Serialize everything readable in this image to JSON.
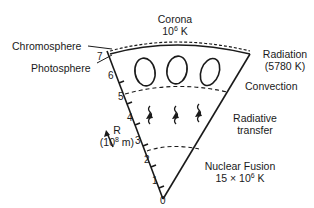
{
  "diagram": {
    "labels": {
      "corona": "Corona",
      "corona_temp_base": "10",
      "corona_temp_exp": "6",
      "corona_temp_unit": " K",
      "chromosphere": "Chromosphere",
      "photosphere": "Photosphere",
      "radiation": "Radiation",
      "radiation_temp": "(5780 K)",
      "convection": "Convection",
      "radiative_line1": "Radiative",
      "radiative_line2": "transfer",
      "fusion": "Nuclear Fusion",
      "fusion_temp_base": "15 × 10",
      "fusion_temp_exp": "6",
      "fusion_temp_unit": " K",
      "axis_name": "R",
      "axis_unit_base": "(10",
      "axis_unit_exp": "8",
      "axis_unit_unit": " m)"
    },
    "axis_ticks": [
      "0",
      "1",
      "2",
      "3",
      "4",
      "5",
      "6",
      "7"
    ],
    "colors": {
      "ink": "#1a1a1a",
      "background": "#ffffff"
    }
  }
}
